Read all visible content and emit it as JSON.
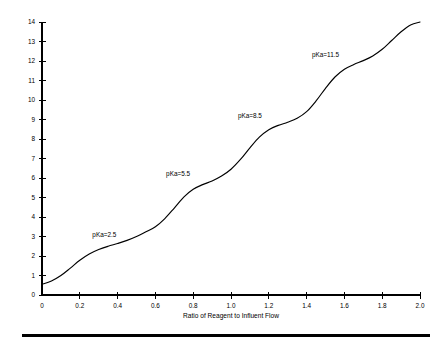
{
  "chart_data": {
    "type": "line",
    "title": "",
    "subtitle": "",
    "xlabel": "Ratio of Reagent to Influent Flow",
    "ylabel": "",
    "xlim": [
      0,
      2.0
    ],
    "ylim": [
      0,
      14
    ],
    "grid": false,
    "legend": "none",
    "xticks": [
      "0",
      "0.2",
      "0.4",
      "0.6",
      "0.8",
      "1.0",
      "1.2",
      "1.4",
      "1.6",
      "1.8",
      "2.0"
    ],
    "xtick_values": [
      0,
      0.2,
      0.4,
      0.6,
      0.8,
      1.0,
      1.2,
      1.4,
      1.6,
      1.8,
      2.0
    ],
    "yticks": [
      "0",
      "1",
      "2",
      "3",
      "4",
      "5",
      "6",
      "7",
      "8",
      "9",
      "10",
      "11",
      "12",
      "13",
      "14"
    ],
    "ytick_values": [
      0,
      1,
      2,
      3,
      4,
      5,
      6,
      7,
      8,
      9,
      10,
      11,
      12,
      13,
      14
    ],
    "series": [
      {
        "name": "Titration curve",
        "color": "#000000",
        "x": [
          0.0,
          0.05,
          0.1,
          0.15,
          0.2,
          0.25,
          0.3,
          0.35,
          0.4,
          0.45,
          0.5,
          0.55,
          0.6,
          0.65,
          0.7,
          0.75,
          0.8,
          0.85,
          0.9,
          0.95,
          1.0,
          1.05,
          1.1,
          1.15,
          1.2,
          1.25,
          1.3,
          1.35,
          1.4,
          1.45,
          1.5,
          1.55,
          1.6,
          1.65,
          1.7,
          1.75,
          1.8,
          1.85,
          1.9,
          1.95,
          2.0
        ],
        "y": [
          0.55,
          0.72,
          1.0,
          1.38,
          1.78,
          2.1,
          2.33,
          2.5,
          2.64,
          2.8,
          3.0,
          3.24,
          3.5,
          3.92,
          4.46,
          5.02,
          5.42,
          5.66,
          5.85,
          6.1,
          6.45,
          6.95,
          7.55,
          8.1,
          8.48,
          8.7,
          8.86,
          9.06,
          9.4,
          9.95,
          10.6,
          11.18,
          11.58,
          11.82,
          12.02,
          12.26,
          12.6,
          13.05,
          13.5,
          13.85,
          14.0
        ]
      }
    ],
    "annotations": [
      {
        "text": "pKa=2.5",
        "x": 0.33,
        "y": 2.95,
        "pka": 2.5
      },
      {
        "text": "pKa=5.5",
        "x": 0.72,
        "y": 6.12,
        "pka": 5.5
      },
      {
        "text": "pKa=8.5",
        "x": 1.1,
        "y": 9.1,
        "pka": 8.5
      },
      {
        "text": "pKa=11.5",
        "x": 1.5,
        "y": 12.18,
        "pka": 11.5
      }
    ]
  },
  "axis": {
    "x_title": "Ratio of Reagent to Influent Flow"
  }
}
